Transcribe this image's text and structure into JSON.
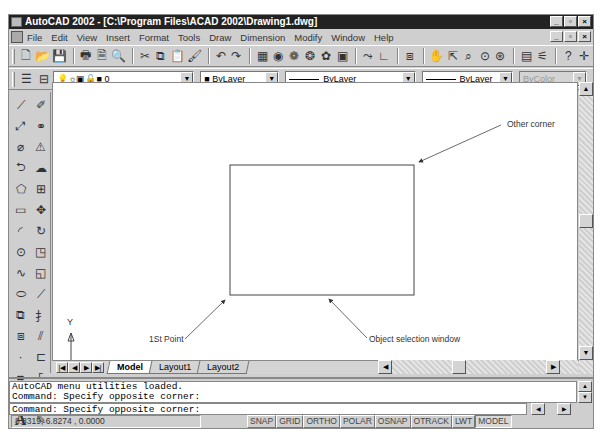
{
  "window": {
    "title": "AutoCAD 2002 - [C:\\Program Files\\ACAD 2002\\Drawing1.dwg]",
    "controls": {
      "minimize": "_",
      "restore": "▫",
      "close": "×"
    }
  },
  "menubar": {
    "items": [
      "File",
      "Edit",
      "View",
      "Insert",
      "Format",
      "Tools",
      "Draw",
      "Dimension",
      "Modify",
      "Window",
      "Help"
    ]
  },
  "standard_toolbar": {
    "icons": [
      "new-icon",
      "open-icon",
      "save-icon",
      "print-icon",
      "print-preview-icon",
      "find-icon",
      "cut-icon",
      "copy-icon",
      "paste-icon",
      "match-properties-icon",
      "undo-icon",
      "redo-icon",
      "design-center-icon",
      "today-icon",
      "web-icon",
      "web-publish-icon",
      "etransmit-icon",
      "toolpalette-icon",
      "ucs-icon",
      "redraw-icon",
      "pan-icon",
      "zoom-realtime-icon",
      "zoom-window-icon",
      "zoom-previous-icon",
      "zoom-extents-icon",
      "properties-icon",
      "adcenter-icon",
      "help-icon",
      "crosshair-icon"
    ]
  },
  "layers_toolbar": {
    "layer_value": "0",
    "color_value": "ByLayer",
    "linetype_value": "ByLayer",
    "lineweight_value": "ByLayer",
    "plotstyle_value": "ByColor"
  },
  "draw_toolbar": {
    "icons": [
      "line-icon",
      "construction-line-icon",
      "polyline-icon",
      "polygon-icon",
      "rectangle-icon",
      "arc-icon",
      "circle-icon",
      "spline-icon",
      "ellipse-icon",
      "insert-block-icon",
      "make-block-icon",
      "point-icon",
      "hatch-icon",
      "region-icon",
      "multiline-text-icon"
    ]
  },
  "modify_toolbar": {
    "icons": [
      "erase-icon",
      "copy-object-icon",
      "mirror-icon",
      "offset-icon",
      "array-icon",
      "move-icon",
      "rotate-icon",
      "scale-icon",
      "stretch-icon",
      "lengthen-icon",
      "trim-icon",
      "extend-icon",
      "break-icon",
      "chamfer-icon",
      "fillet-icon",
      "explode-icon"
    ]
  },
  "canvas": {
    "annotations": {
      "other_corner": "Other corner",
      "first_point": "1St Point",
      "selection_window": "Object selection window"
    },
    "ucs": {
      "x_label": "X",
      "y_label": "Y"
    },
    "rectangle": {
      "x": 177,
      "y": 82,
      "w": 184,
      "h": 130
    }
  },
  "layout_tabs": [
    "Model",
    "Layout1",
    "Layout2"
  ],
  "active_tab": "Model",
  "command": {
    "history": [
      "AutoCAD menu utilities loaded.",
      "Command: Specify opposite corner:"
    ],
    "current": "Command: Specify opposite corner:"
  },
  "statusbar": {
    "coordinates": "8.8319, 6.8274 , 0.0000",
    "toggles": [
      {
        "label": "SNAP",
        "on": false
      },
      {
        "label": "GRID",
        "on": false
      },
      {
        "label": "ORTHO",
        "on": false
      },
      {
        "label": "POLAR",
        "on": false
      },
      {
        "label": "OSNAP",
        "on": false
      },
      {
        "label": "OTRACK",
        "on": false
      },
      {
        "label": "LWT",
        "on": false
      },
      {
        "label": "MODEL",
        "on": true
      }
    ]
  }
}
